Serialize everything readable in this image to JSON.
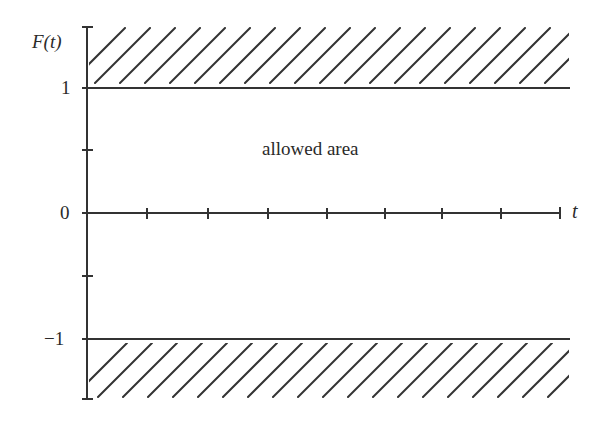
{
  "diagram": {
    "y_axis_label": "F(t)",
    "x_axis_label": "t",
    "y_ticks": [
      {
        "label": "1",
        "value": 1
      },
      {
        "label": "0",
        "value": 0
      },
      {
        "label": "−1",
        "value": -1
      }
    ],
    "annotation": "allowed area",
    "regions": [
      {
        "name": "forbidden-upper",
        "range": "F(t) > 1",
        "style": "hatched"
      },
      {
        "name": "allowed",
        "range": "-1 <= F(t) <= 1",
        "style": "blank"
      },
      {
        "name": "forbidden-lower",
        "range": "F(t) < -1",
        "style": "hatched"
      }
    ],
    "x_tick_count": 8,
    "colors": {
      "line": "#333333",
      "background": "#ffffff"
    }
  }
}
